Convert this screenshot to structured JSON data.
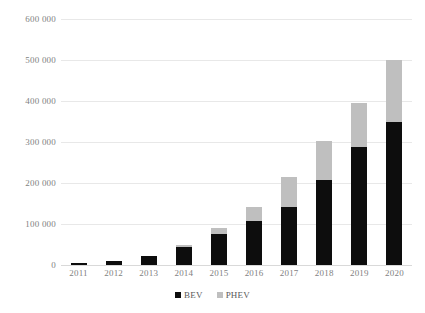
{
  "chart_data": {
    "type": "bar",
    "subtype": "stacked-bar",
    "title": "",
    "subtitle": "",
    "xlabel": "",
    "ylabel": "",
    "categories": [
      "2011",
      "2012",
      "2013",
      "2014",
      "2015",
      "2016",
      "2017",
      "2018",
      "2019",
      "2020"
    ],
    "series": [
      {
        "name": "BEV",
        "color": "#0d0d0d",
        "values": [
          6000,
          10000,
          21000,
          45000,
          76000,
          107000,
          142000,
          207000,
          288000,
          350000
        ]
      },
      {
        "name": "PHEV",
        "color": "#bfbfbf",
        "values": [
          0,
          0,
          0,
          4000,
          14000,
          35000,
          73000,
          96000,
          107000,
          150000
        ]
      }
    ],
    "totals": [
      6000,
      10000,
      21000,
      49000,
      90000,
      142000,
      215000,
      303000,
      395000,
      500000
    ],
    "ylim": [
      0,
      600000
    ],
    "y_ticks": [
      0,
      100000,
      200000,
      300000,
      400000,
      500000,
      600000
    ],
    "y_tick_labels": [
      "0",
      "100 000",
      "200 000",
      "300 000",
      "400 000",
      "500 000",
      "600 000"
    ],
    "grid": true,
    "grid_axis": "y",
    "legend_position": "bottom",
    "legend_entries": [
      "BEV",
      "PHEV"
    ]
  },
  "colors": {
    "background": "#ffffff",
    "gridline": "#e8e8e8",
    "baseline": "#d9d9d9",
    "axis_text": "#7f7f7f",
    "legend_text": "#595959",
    "bev": "#0d0d0d",
    "phev": "#bfbfbf"
  },
  "legend": {
    "items": [
      {
        "label": "BEV",
        "swatch": "bev-swatch-icon"
      },
      {
        "label": "PHEV",
        "swatch": "phev-swatch-icon"
      }
    ]
  }
}
